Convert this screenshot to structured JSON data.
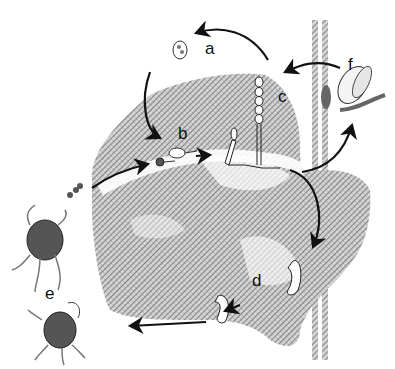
{
  "diagram": {
    "labels": {
      "a": "a",
      "b": "b",
      "c": "c",
      "d": "d",
      "e": "e",
      "f": "f"
    },
    "colors": {
      "background": "#ffffff",
      "ink": "#111111",
      "leaf_shading": "#8a8a8a",
      "leaf_light": "#c8c8c8",
      "sclerotium": "#555555"
    }
  }
}
